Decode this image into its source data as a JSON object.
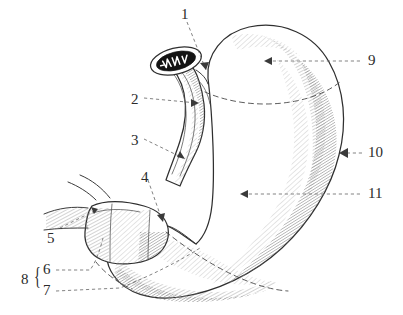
{
  "figure": {
    "background_color": "#ffffff",
    "ink_color": "#2f2f2f",
    "label_color": "#2b2b2b",
    "width": 403,
    "height": 315
  },
  "labels": [
    {
      "id": "1",
      "text": "1",
      "x": 181,
      "y": 7,
      "leader": "dashed",
      "arrow_direction": "down-right"
    },
    {
      "id": "2",
      "text": "2",
      "x": 131,
      "y": 92,
      "leader": "dashed",
      "arrow_direction": "right"
    },
    {
      "id": "3",
      "text": "3",
      "x": 131,
      "y": 133,
      "leader": "dashed",
      "arrow_direction": "down-right"
    },
    {
      "id": "4",
      "text": "4",
      "x": 141,
      "y": 170,
      "leader": "dashed",
      "arrow_direction": "down-right"
    },
    {
      "id": "5",
      "text": "5",
      "x": 47,
      "y": 231,
      "leader": "dashed",
      "arrow_direction": "up-right"
    },
    {
      "id": "6",
      "text": "6",
      "x": 43,
      "y": 267,
      "leader": "dashed",
      "arrow_direction": "right"
    },
    {
      "id": "7",
      "text": "7",
      "x": 43,
      "y": 288,
      "leader": "dashed",
      "arrow_direction": "right"
    },
    {
      "id": "8",
      "text": "8",
      "x": 21,
      "y": 277,
      "leader": "brace",
      "arrow_direction": "none"
    },
    {
      "id": "9",
      "text": "9",
      "x": 368,
      "y": 55,
      "leader": "dashed",
      "arrow_direction": "left"
    },
    {
      "id": "10",
      "text": "10",
      "x": 368,
      "y": 147,
      "leader": "dashed",
      "arrow_direction": "left"
    },
    {
      "id": "11",
      "text": "11",
      "x": 368,
      "y": 188,
      "leader": "dashed",
      "arrow_direction": "left"
    }
  ],
  "brace": {
    "glyph": "{",
    "groups_labels": [
      "6",
      "7"
    ],
    "group_label": "8"
  }
}
